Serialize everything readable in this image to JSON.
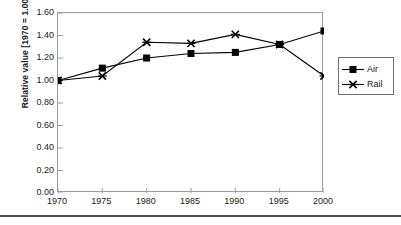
{
  "chart_data": {
    "type": "line",
    "title": "",
    "xlabel": "",
    "ylabel": "Relative value [1970 = 1.00]",
    "categories": [
      "1970",
      "1975",
      "1980",
      "1985",
      "1990",
      "1995",
      "2000"
    ],
    "x": [
      1970,
      1975,
      1980,
      1985,
      1990,
      1995,
      2000
    ],
    "series": [
      {
        "name": "Air",
        "marker": "square",
        "values": [
          1.0,
          1.11,
          1.2,
          1.24,
          1.25,
          1.32,
          1.44
        ]
      },
      {
        "name": "Rail",
        "marker": "cross",
        "values": [
          1.0,
          1.04,
          1.34,
          1.33,
          1.41,
          1.32,
          1.04
        ]
      }
    ],
    "ylim": [
      0.0,
      1.6
    ],
    "xlim": [
      1970,
      2000
    ],
    "ytick_labels": [
      "1.60",
      "1.40",
      "1.20",
      "1.00",
      "0.80",
      "0.60",
      "0.40",
      "0.20",
      "0.00"
    ],
    "ytick_values": [
      1.6,
      1.4,
      1.2,
      1.0,
      0.8,
      0.6,
      0.4,
      0.2,
      0.0
    ],
    "grid": false,
    "legend_position": "right",
    "line_color": "#000000",
    "frame_color": "#9a9a9a"
  },
  "legend": {
    "items": [
      {
        "label": "Air"
      },
      {
        "label": "Rail"
      }
    ]
  },
  "caption": {
    "text": ""
  }
}
